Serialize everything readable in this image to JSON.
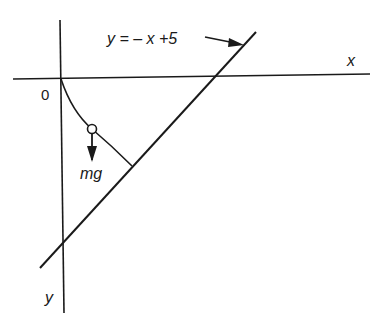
{
  "diagram": {
    "type": "physics-trajectory",
    "labels": {
      "line_equation": "y = – x +5",
      "x_axis": "x",
      "y_axis": "y",
      "origin": "0",
      "force": "mg"
    },
    "elements": [
      {
        "id": "x-axis",
        "kind": "line",
        "label": "x"
      },
      {
        "id": "y-axis",
        "kind": "line",
        "label": "y",
        "direction": "downward"
      },
      {
        "id": "incline-line",
        "kind": "line",
        "equation": "y = -x + 5"
      },
      {
        "id": "trajectory-curve",
        "kind": "curve",
        "from": "origin",
        "to": "incline-line"
      },
      {
        "id": "particle",
        "kind": "circle",
        "on": "trajectory-curve"
      },
      {
        "id": "gravity-arrow",
        "kind": "arrow",
        "label": "mg",
        "direction": "down"
      },
      {
        "id": "equation-pointer-arrow",
        "kind": "arrow",
        "points_to": "incline-line"
      }
    ],
    "colors": {
      "stroke": "#1a1a1a",
      "background": "#ffffff"
    }
  }
}
